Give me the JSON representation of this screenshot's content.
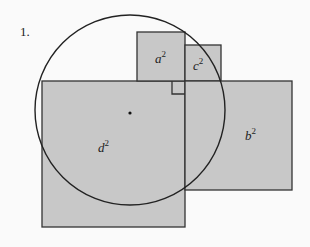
{
  "figure": {
    "number_label": "1.",
    "fill_color": "#c8c8c8",
    "stroke_color": "#333333",
    "squares": [
      {
        "id": "d",
        "label": "d",
        "exponent": "2",
        "x": 42,
        "y": 81,
        "w": 143,
        "h": 146
      },
      {
        "id": "a",
        "label": "a",
        "exponent": "2",
        "x": 137,
        "y": 32,
        "w": 48,
        "h": 49
      },
      {
        "id": "c",
        "label": "c",
        "exponent": "2",
        "x": 185,
        "y": 45,
        "w": 36,
        "h": 36
      },
      {
        "id": "b",
        "label": "b",
        "exponent": "2",
        "x": 185,
        "y": 81,
        "w": 107,
        "h": 109
      }
    ],
    "circle": {
      "cx": 130,
      "cy": 110,
      "r": 95
    },
    "center_point": {
      "x": 130,
      "y": 113
    },
    "right_angle_marker": {
      "x": 172,
      "y": 81,
      "size": 13
    }
  }
}
